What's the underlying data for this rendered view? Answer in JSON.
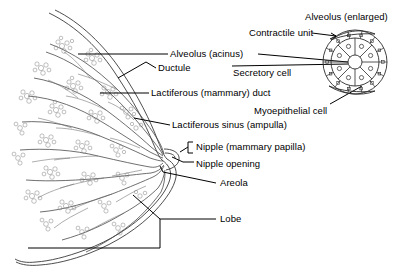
{
  "figure": {
    "background_color": "#ffffff",
    "line_color": "#000000",
    "tissue_line_color": "#555555",
    "width": 406,
    "height": 276
  },
  "labels": {
    "alveolus_enlarged": "Alveolus (enlarged)",
    "contractile_unit": "Contractile unit",
    "alveolus_acinus": "Alveolus (acinus)",
    "ductule": "Ductule",
    "secretory_cell": "Secretory cell",
    "lactiferous_duct": "Lactiferous (mammary) duct",
    "myoepithelial_cell": "Myoepithelial cell",
    "lactiferous_sinus": "Lactiferous sinus (ampulla)",
    "nipple": "Nipple (mammary papilla)",
    "nipple_opening": "Nipple opening",
    "areola": "Areola",
    "lobe": "Lobe"
  },
  "label_positions": {
    "alveolus_enlarged": {
      "x": 305,
      "y": 11
    },
    "contractile_unit": {
      "x": 249,
      "y": 30
    },
    "alveolus_acinus": {
      "x": 170,
      "y": 51
    },
    "ductule": {
      "x": 158,
      "y": 66
    },
    "secretory_cell": {
      "x": 233,
      "y": 70
    },
    "lactiferous_duct": {
      "x": 151,
      "y": 90
    },
    "myoepithelial_cell": {
      "x": 254,
      "y": 108
    },
    "lactiferous_sinus": {
      "x": 172,
      "y": 122
    },
    "nipple": {
      "x": 196,
      "y": 144
    },
    "nipple_opening": {
      "x": 196,
      "y": 161
    },
    "areola": {
      "x": 220,
      "y": 180
    },
    "lobe": {
      "x": 220,
      "y": 216
    }
  },
  "inset": {
    "name": "alveolus-enlarged-diagram",
    "center_x": 355,
    "center_y": 62,
    "lumen_radius": 7,
    "secretory_ring_radius": 24,
    "myoepithelial_ring_radius": 32,
    "secretory_cell_count": 8,
    "myoepithelial_cell_count": 14
  }
}
